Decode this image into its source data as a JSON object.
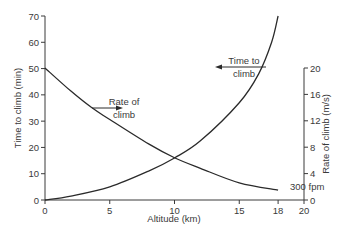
{
  "chart_data": {
    "type": "line",
    "title": "",
    "xlabel": "Altitude (km)",
    "ylabel": "Time to climb (min)",
    "y2label": "Rate of climb (m/s)",
    "xlim": [
      0,
      20
    ],
    "ylim": [
      0,
      70
    ],
    "y2lim": [
      0,
      20
    ],
    "xticks": [
      0,
      5,
      10,
      15,
      18,
      20
    ],
    "yticks": [
      0,
      10,
      20,
      30,
      40,
      50,
      60,
      70
    ],
    "y2ticks": [
      0,
      4,
      8,
      12,
      16,
      20
    ],
    "grid": false,
    "legend": null,
    "series": [
      {
        "name": "Time to climb",
        "axis": "left",
        "x": [
          0,
          2,
          5,
          8,
          10,
          12,
          15,
          16.5,
          17.5,
          18
        ],
        "values": [
          0,
          1.5,
          5,
          11,
          16,
          22.5,
          37,
          48,
          60,
          70
        ],
        "markers_at": [
          5,
          15
        ]
      },
      {
        "name": "Rate of climb",
        "axis": "right",
        "x": [
          0,
          2,
          3.6,
          5,
          8,
          10,
          12,
          15,
          18
        ],
        "values": [
          20,
          16.5,
          14,
          12.2,
          8.5,
          6.4,
          4.8,
          2.6,
          1.5
        ],
        "markers_at": [
          3.6,
          15
        ]
      }
    ],
    "annotations": [
      {
        "text_line1": "Time to",
        "text_line2": "climb",
        "arrow": "left",
        "points_to": "Time to climb curve"
      },
      {
        "text_line1": "Rate of",
        "text_line2": "climb",
        "arrow": "right",
        "points_to": "Rate of climb curve"
      },
      {
        "text": "300 fpm",
        "at_x": 18
      }
    ]
  },
  "labels": {
    "xlabel": "Altitude (km)",
    "ylabel": "Time to climb (min)",
    "y2label": "Rate of climb (m/s)",
    "time_annot_1": "Time to",
    "time_annot_2": "climb",
    "rate_annot_1": "Rate of",
    "rate_annot_2": "climb",
    "fpm_annot": "300 fpm"
  },
  "colors": {
    "axis": "#3a3a3a",
    "curve": "#2a2a2a",
    "text": "#3a3a3a",
    "background": "#ffffff"
  }
}
